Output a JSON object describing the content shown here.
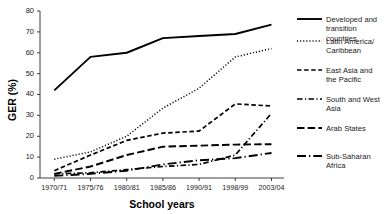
{
  "chart_data": {
    "type": "line",
    "title": "",
    "xlabel": "School years",
    "ylabel": "GER (%)",
    "categories": [
      "1970/71",
      "1975/76",
      "1980/81",
      "1985/86",
      "1990/91",
      "1998/99",
      "2003/04"
    ],
    "ylim": [
      0,
      80
    ],
    "yticks": [
      0,
      10,
      20,
      30,
      40,
      50,
      60,
      70,
      80
    ],
    "grid": false,
    "legend_position": "right",
    "series": [
      {
        "name": "Developed and transition countries",
        "style": "solid",
        "values": [
          42,
          58,
          60,
          67,
          68,
          69,
          73.5
        ]
      },
      {
        "name": "Latin America/ Caribbean",
        "style": "dotted",
        "values": [
          9,
          12.5,
          20,
          33.5,
          43,
          58,
          62
        ]
      },
      {
        "name": "East Asia and the Pacific",
        "style": "dashed",
        "values": [
          3.5,
          11,
          18,
          21.5,
          22.5,
          35.5,
          34.5
        ]
      },
      {
        "name": "South and West Asia",
        "style": "dash-dot",
        "values": [
          2,
          2.5,
          4,
          5.5,
          6.5,
          11,
          31
        ]
      },
      {
        "name": "Arab States",
        "style": "long-dash",
        "values": [
          2,
          5.5,
          11,
          15,
          15.5,
          16,
          16.2
        ]
      },
      {
        "name": "Sub-Saharan Africa",
        "style": "long-dash-dot",
        "values": [
          1,
          2,
          3.5,
          6.5,
          8.5,
          9.5,
          12
        ]
      }
    ]
  },
  "axis": {
    "y_title": "GER (%)",
    "x_title": "School years",
    "y_tick_labels": [
      "0",
      "10",
      "20",
      "30",
      "40",
      "50",
      "60",
      "70",
      "80"
    ],
    "x_tick_labels": [
      "1970/71",
      "1975/76",
      "1980/81",
      "1985/86",
      "1990/91",
      "1998/99",
      "2003/04"
    ]
  },
  "legend": {
    "items": [
      {
        "label_line1": "Developed and",
        "label_line2": "transition",
        "label_line3": "countries",
        "style": "solid"
      },
      {
        "label_line1": "Latin America/",
        "label_line2": "Caribbean",
        "label_line3": "",
        "style": "dotted"
      },
      {
        "label_line1": "East Asia and",
        "label_line2": "the Pacific",
        "label_line3": "",
        "style": "dashed"
      },
      {
        "label_line1": "South and West",
        "label_line2": "Asia",
        "label_line3": "",
        "style": "dash-dot"
      },
      {
        "label_line1": "Arab States",
        "label_line2": "",
        "label_line3": "",
        "style": "long-dash"
      },
      {
        "label_line1": "Sub-Saharan",
        "label_line2": "Africa",
        "label_line3": "",
        "style": "long-dash-dot"
      }
    ]
  },
  "colors": {
    "line": "#000000",
    "axis": "#2b2b2b",
    "background": "#ffffff",
    "text": "#1a1a1a"
  }
}
